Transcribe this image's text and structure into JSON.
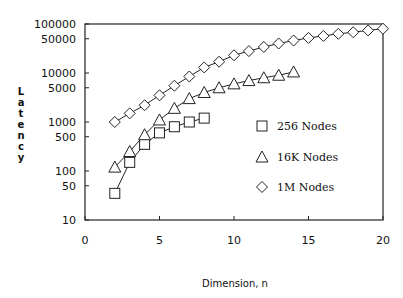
{
  "chart_data": {
    "type": "line",
    "title": "",
    "xlabel": "Dimension, n",
    "ylabel": "Latency",
    "xlim": [
      0,
      20
    ],
    "ylim": [
      10,
      100000
    ],
    "yscale": "log",
    "grid": false,
    "legend_position": "inside-right",
    "x_ticks": [
      0,
      5,
      10,
      15,
      20
    ],
    "y_ticks": [
      10,
      50,
      100,
      500,
      1000,
      5000,
      10000,
      50000,
      100000
    ],
    "y_tick_labels": [
      "10",
      "50",
      "100",
      "500",
      "1000",
      "5000",
      "10000",
      "50000",
      "100000"
    ],
    "series": [
      {
        "name": "256 Nodes",
        "marker": "square",
        "x": [
          2,
          3,
          4,
          5,
          6,
          7,
          8
        ],
        "values": [
          35,
          150,
          350,
          600,
          800,
          1000,
          1200
        ]
      },
      {
        "name": "16K Nodes",
        "marker": "triangle",
        "x": [
          2,
          3,
          4,
          5,
          6,
          7,
          8,
          9,
          10,
          11,
          12,
          13,
          14
        ],
        "values": [
          120,
          250,
          550,
          1100,
          1900,
          3000,
          4000,
          5000,
          6000,
          7000,
          8000,
          9000,
          10500
        ]
      },
      {
        "name": "1M Nodes",
        "marker": "diamond",
        "x": [
          2,
          3,
          4,
          5,
          6,
          7,
          8,
          9,
          10,
          11,
          12,
          13,
          14,
          15,
          16,
          17,
          18,
          19,
          20
        ],
        "values": [
          1000,
          1500,
          2200,
          3500,
          5500,
          8500,
          13000,
          17000,
          23000,
          28000,
          34000,
          40000,
          46000,
          52000,
          57000,
          63000,
          68000,
          74000,
          80000
        ]
      }
    ]
  },
  "axes": {
    "xlabel": "Dimension, n",
    "ylabel_letters": [
      "L",
      "a",
      "t",
      "e",
      "n",
      "c",
      "y"
    ]
  }
}
